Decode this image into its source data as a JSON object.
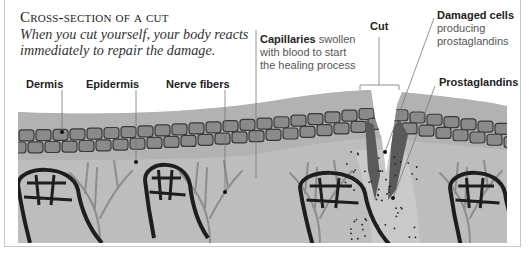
{
  "header": {
    "title": "Cross-section of a cut",
    "subtitle": "When you cut yourself, your body reacts immediately to repair the damage."
  },
  "labels": {
    "dermis": "Dermis",
    "epidermis": "Epidermis",
    "nerve_fibers": "Nerve fibers",
    "capillaries_bold": "Capillaries",
    "capillaries_rest_1": " swollen",
    "capillaries_rest_2": "with blood to start",
    "capillaries_rest_3": "the healing process",
    "cut": "Cut",
    "damaged_cells_bold": "Damaged cells",
    "damaged_cells_rest_1": "producing",
    "damaged_cells_rest_2": "prostaglandins",
    "prostaglandins": "Prostaglandins"
  },
  "colors": {
    "dermis_top": "#b4b4b4",
    "cell_layer": "#8a8a8a",
    "tissue": "#bdbdbd",
    "capillary": "#1e1e1e",
    "nerve": "#8d8d8d",
    "wound_dark": "#555555",
    "leader": "#777777"
  }
}
